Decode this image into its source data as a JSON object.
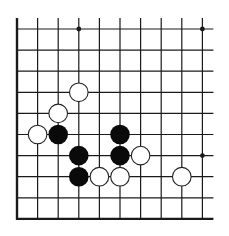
{
  "diagram": {
    "type": "go-board-fragment",
    "columns": 10,
    "rows": 10,
    "origin": {
      "x": 17,
      "y": 29
    },
    "spacing": {
      "x": 20.6,
      "y": 21.1
    },
    "line_color": "#1a1a1a",
    "edges": {
      "left": true,
      "bottom": true,
      "top": false,
      "right": false
    },
    "star_points": [
      {
        "col": 3,
        "row": 0
      },
      {
        "col": 9,
        "row": 0
      },
      {
        "col": 9,
        "row": 6
      }
    ],
    "stones": [
      {
        "color": "white",
        "col": 3,
        "row": 3
      },
      {
        "color": "white",
        "col": 2,
        "row": 4
      },
      {
        "color": "white",
        "col": 1,
        "row": 5
      },
      {
        "color": "black",
        "col": 2,
        "row": 5
      },
      {
        "color": "black",
        "col": 5,
        "row": 5
      },
      {
        "color": "black",
        "col": 3,
        "row": 6
      },
      {
        "color": "black",
        "col": 5,
        "row": 6
      },
      {
        "color": "white",
        "col": 6,
        "row": 6
      },
      {
        "color": "black",
        "col": 3,
        "row": 7
      },
      {
        "color": "white",
        "col": 4,
        "row": 7
      },
      {
        "color": "white",
        "col": 5,
        "row": 7
      },
      {
        "color": "white",
        "col": 8,
        "row": 7
      }
    ],
    "colors": {
      "black_stone": "#0a0a0a",
      "white_stone_fill": "#ffffff",
      "white_stone_stroke": "#222222"
    }
  }
}
